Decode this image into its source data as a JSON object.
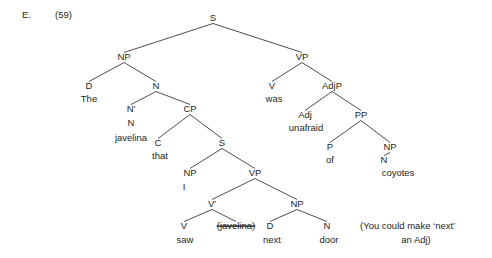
{
  "example": {
    "letter": "E.",
    "number": "(59)"
  },
  "note": {
    "line1": "(You could make ‘next’",
    "line2": "an Adj)"
  },
  "tree": {
    "nodes": [
      {
        "id": "S_root",
        "label": "S",
        "x": 213,
        "y": 21,
        "anchor": "middle"
      },
      {
        "id": "NP_subj",
        "label": "NP",
        "x": 124,
        "y": 60,
        "anchor": "middle"
      },
      {
        "id": "VP_main",
        "label": "VP",
        "x": 302,
        "y": 60,
        "anchor": "middle"
      },
      {
        "id": "D_the",
        "label": "D",
        "x": 89,
        "y": 89,
        "anchor": "middle"
      },
      {
        "id": "N_head",
        "label": "N",
        "x": 156,
        "y": 89,
        "anchor": "middle"
      },
      {
        "id": "V_was",
        "label": "V",
        "x": 272,
        "y": 89,
        "anchor": "middle"
      },
      {
        "id": "AdjP",
        "label": "AdjP",
        "x": 332,
        "y": 89,
        "anchor": "middle"
      },
      {
        "id": "Nbar",
        "label": "N′",
        "x": 131,
        "y": 112,
        "anchor": "middle"
      },
      {
        "id": "N_inner",
        "label": "N",
        "x": 131,
        "y": 126,
        "anchor": "middle"
      },
      {
        "id": "CP",
        "label": "CP",
        "x": 190,
        "y": 112,
        "anchor": "middle"
      },
      {
        "id": "Adj",
        "label": "Adj",
        "x": 305,
        "y": 118,
        "anchor": "middle"
      },
      {
        "id": "PP",
        "label": "PP",
        "x": 361,
        "y": 118,
        "anchor": "middle"
      },
      {
        "id": "C_that",
        "label": "C",
        "x": 158,
        "y": 146,
        "anchor": "middle"
      },
      {
        "id": "S_embed",
        "label": "S",
        "x": 222,
        "y": 146,
        "anchor": "middle"
      },
      {
        "id": "P_of",
        "label": "P",
        "x": 330,
        "y": 150,
        "anchor": "middle"
      },
      {
        "id": "NP_coy",
        "label": "NP",
        "x": 390,
        "y": 150,
        "anchor": "middle"
      },
      {
        "id": "N_coy",
        "label": "N",
        "x": 384,
        "y": 163,
        "anchor": "middle"
      },
      {
        "id": "NP_I",
        "label": "NP",
        "x": 190,
        "y": 176,
        "anchor": "middle"
      },
      {
        "id": "VP_embed",
        "label": "VP",
        "x": 255,
        "y": 176,
        "anchor": "middle"
      },
      {
        "id": "Vbar",
        "label": "V′",
        "x": 212,
        "y": 207,
        "anchor": "middle"
      },
      {
        "id": "NP_next",
        "label": "NP",
        "x": 297,
        "y": 207,
        "anchor": "middle"
      },
      {
        "id": "V_saw",
        "label": "V",
        "x": 184,
        "y": 229,
        "anchor": "middle"
      },
      {
        "id": "D_next",
        "label": "D",
        "x": 270,
        "y": 229,
        "anchor": "middle"
      },
      {
        "id": "N_door",
        "label": "N",
        "x": 327,
        "y": 229,
        "anchor": "middle"
      }
    ],
    "leaves": [
      {
        "id": "word_the",
        "word": "The",
        "x": 89,
        "y": 102,
        "anchor": "middle",
        "trace": false
      },
      {
        "id": "word_was",
        "word": "was",
        "x": 274,
        "y": 102,
        "anchor": "middle",
        "trace": false
      },
      {
        "id": "word_javelina",
        "word": "javelina",
        "x": 131,
        "y": 141,
        "anchor": "middle",
        "trace": false
      },
      {
        "id": "word_unafraid",
        "word": "unafraid",
        "x": 306,
        "y": 131,
        "anchor": "middle",
        "trace": false
      },
      {
        "id": "word_that",
        "word": "that",
        "x": 160,
        "y": 159,
        "anchor": "middle",
        "trace": false
      },
      {
        "id": "word_of",
        "word": "of",
        "x": 330,
        "y": 163,
        "anchor": "middle",
        "trace": false
      },
      {
        "id": "word_coyotes",
        "word": "coyotes",
        "x": 398,
        "y": 176,
        "anchor": "middle",
        "trace": false
      },
      {
        "id": "word_i",
        "word": "I",
        "x": 184,
        "y": 190,
        "anchor": "middle",
        "trace": false
      },
      {
        "id": "word_saw",
        "word": "saw",
        "x": 185,
        "y": 243,
        "anchor": "middle",
        "trace": false
      },
      {
        "id": "word_trace",
        "word": "(javelina)",
        "x": 236,
        "y": 229,
        "anchor": "middle",
        "trace": true
      },
      {
        "id": "word_next",
        "word": "next",
        "x": 272,
        "y": 243,
        "anchor": "middle",
        "trace": false
      },
      {
        "id": "word_door",
        "word": "door",
        "x": 329,
        "y": 243,
        "anchor": "middle",
        "trace": false
      }
    ],
    "branches": [
      {
        "id": "b-s-np",
        "from": "S_root",
        "to": "NP_subj"
      },
      {
        "id": "b-s-vp",
        "from": "S_root",
        "to": "VP_main"
      },
      {
        "id": "b-np-d",
        "from": "NP_subj",
        "to": "D_the"
      },
      {
        "id": "b-np-n",
        "from": "NP_subj",
        "to": "N_head"
      },
      {
        "id": "b-vp-v",
        "from": "VP_main",
        "to": "V_was"
      },
      {
        "id": "b-vp-adjp",
        "from": "VP_main",
        "to": "AdjP"
      },
      {
        "id": "b-n-nbar",
        "from": "N_head",
        "to": "Nbar"
      },
      {
        "id": "b-n-cp",
        "from": "N_head",
        "to": "CP"
      },
      {
        "id": "b-adjp-adj",
        "from": "AdjP",
        "to": "Adj"
      },
      {
        "id": "b-adjp-pp",
        "from": "AdjP",
        "to": "PP"
      },
      {
        "id": "b-cp-c",
        "from": "CP",
        "to": "C_that"
      },
      {
        "id": "b-cp-s",
        "from": "CP",
        "to": "S_embed"
      },
      {
        "id": "b-pp-p",
        "from": "PP",
        "to": "P_of"
      },
      {
        "id": "b-pp-np",
        "from": "PP",
        "to": "NP_coy"
      },
      {
        "id": "b-s2-np",
        "from": "S_embed",
        "to": "NP_I"
      },
      {
        "id": "b-s2-vp",
        "from": "S_embed",
        "to": "VP_embed"
      },
      {
        "id": "b-vp2-vbar",
        "from": "VP_embed",
        "to": "Vbar"
      },
      {
        "id": "b-vp2-np",
        "from": "VP_embed",
        "to": "NP_next"
      },
      {
        "id": "b-vbar-v",
        "from": "Vbar",
        "to": "V_saw"
      },
      {
        "id": "b-vbar-trace",
        "from": "Vbar",
        "to": "word_trace"
      },
      {
        "id": "b-npnext-d",
        "from": "NP_next",
        "to": "D_next"
      },
      {
        "id": "b-npnext-n",
        "from": "NP_next",
        "to": "N_door"
      },
      {
        "id": "b-npcoy-n",
        "from": "NP_coy",
        "to": "N_coy"
      }
    ],
    "colors": {
      "text": "#231f20",
      "line": "#231f20",
      "background": "#ffffff"
    }
  }
}
